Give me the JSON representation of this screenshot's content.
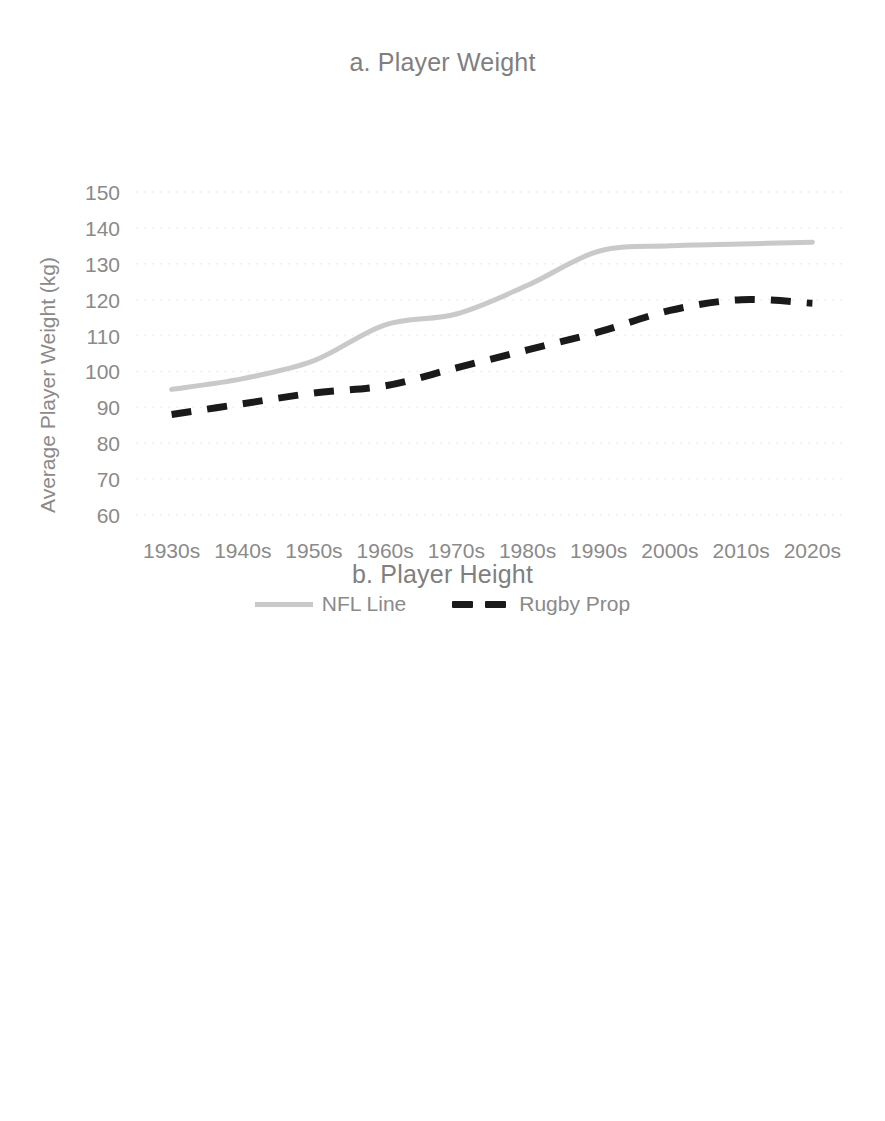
{
  "figure": {
    "background_color": "#ffffff",
    "text_color": "#8a8a8a",
    "nfl_color": "#c9c9c9",
    "rugby_color": "#1a1a1a"
  },
  "chart_data": [
    {
      "type": "line",
      "panel_label": "a",
      "title": "a. Player Weight",
      "xlabel": "",
      "ylabel": "Average Player Weight (kg)",
      "categories": [
        "1930s",
        "1940s",
        "1950s",
        "1960s",
        "1970s",
        "1980s",
        "1990s",
        "2000s",
        "2010s",
        "2020s"
      ],
      "ylim": [
        60,
        150
      ],
      "yticks": [
        "150",
        "140",
        "130",
        "120",
        "110",
        "100",
        "90",
        "80",
        "70",
        "60"
      ],
      "ytick_values": [
        150,
        140,
        130,
        120,
        110,
        100,
        90,
        80,
        70,
        60
      ],
      "grid": true,
      "legend_position": "bottom",
      "series": [
        {
          "name": "NFL Line",
          "style": "solid",
          "color": "#c9c9c9",
          "values": [
            95,
            98,
            103,
            113,
            116,
            124,
            133.5,
            135,
            135.5,
            136
          ]
        },
        {
          "name": "Rugby Prop",
          "style": "dashed",
          "color": "#1a1a1a",
          "values": [
            88,
            91,
            94,
            96,
            101,
            106,
            111,
            117,
            120,
            119
          ]
        }
      ]
    },
    {
      "type": "line",
      "panel_label": "b",
      "title": "b. Player Height",
      "xlabel": "",
      "ylabel": "Average Player Height (m)",
      "categories": [
        "1930s",
        "1940s",
        "1950s",
        "1960s",
        "1970s",
        "1980s",
        "1990s",
        "2000s",
        "2010s",
        "2020s"
      ],
      "ylim": [
        1.7,
        2.0
      ],
      "yticks": [
        "2.00",
        "1.95",
        "1.90",
        "1.85",
        "1.80",
        "1.75",
        "1.70"
      ],
      "ytick_values": [
        2.0,
        1.95,
        1.9,
        1.85,
        1.8,
        1.75,
        1.7
      ],
      "grid": true,
      "legend_position": "bottom",
      "series": [
        {
          "name": "NFL Line",
          "style": "solid",
          "color": "#c9c9c9",
          "values": [
            1.848,
            1.855,
            1.878,
            1.908,
            1.93,
            1.93,
            1.932,
            1.929,
            1.931,
            1.942
          ]
        },
        {
          "name": "Rugby Lock",
          "style": "dashed",
          "color": "#1a1a1a",
          "values": [
            1.863,
            1.863,
            1.873,
            1.932,
            1.952,
            1.975,
            1.99,
            1.992,
            1.993,
            1.995
          ]
        }
      ]
    }
  ]
}
